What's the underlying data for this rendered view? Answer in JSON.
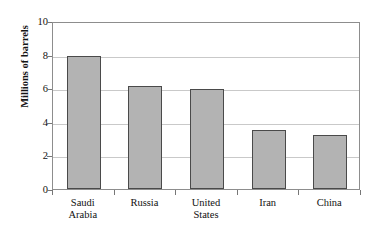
{
  "chart_data": {
    "type": "bar",
    "title": "",
    "title_note": "title is cropped off the top edge of the screenshot and is illegible",
    "xlabel": "",
    "ylabel": "Millions of barrels",
    "categories": [
      "Saudi Arabia",
      "Russia",
      "United States",
      "Iran",
      "China"
    ],
    "category_lines": [
      [
        "Saudi",
        "Arabia"
      ],
      [
        "Russia"
      ],
      [
        "United",
        "States"
      ],
      [
        "Iran"
      ],
      [
        "China"
      ]
    ],
    "values": [
      7.9,
      6.15,
      5.95,
      3.5,
      3.2
    ],
    "ylim": [
      0,
      10
    ],
    "ytick_values": [
      0,
      2,
      4,
      6,
      8,
      10
    ],
    "ytick_labels": [
      "0",
      "2",
      "4",
      "6",
      "8",
      "10"
    ],
    "grid": true,
    "grid_axis": "y",
    "legend": false,
    "bar_fill_color": "#b3b3b3",
    "bar_edge_color": "#4a4a4a",
    "gridline_color": "#c9c9c9",
    "frame_color": "#8d8d8d"
  }
}
